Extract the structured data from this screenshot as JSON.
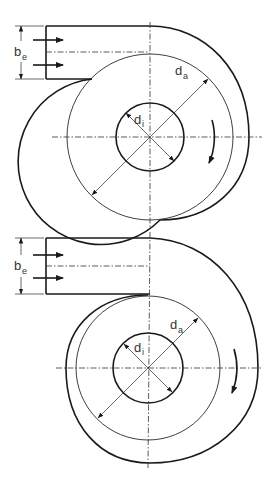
{
  "figure": {
    "views": [
      {
        "name": "top-view",
        "labels": {
          "inlet_width": {
            "main": "b",
            "sub": "e"
          },
          "outer_diameter": {
            "main": "d",
            "sub": "a"
          },
          "inner_diameter": {
            "main": "d",
            "sub": "i"
          }
        },
        "rotation": "clockwise"
      },
      {
        "name": "bottom-view",
        "labels": {
          "inlet_width": {
            "main": "b",
            "sub": "e"
          },
          "outer_diameter": {
            "main": "d",
            "sub": "a"
          },
          "inner_diameter": {
            "main": "d",
            "sub": "i"
          }
        },
        "rotation": "clockwise"
      }
    ],
    "colors": {
      "line": "#1a1a1a",
      "background": "#ffffff"
    }
  }
}
